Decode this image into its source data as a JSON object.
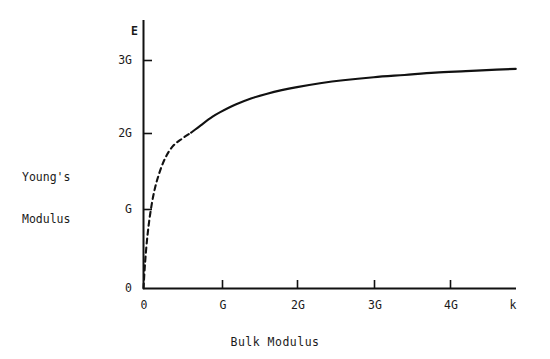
{
  "chart_data": {
    "type": "line",
    "title": "",
    "xlabel": "Bulk Modulus",
    "ylabel": "Young's Modulus",
    "x_axis_variable": "k",
    "y_axis_variable": "E",
    "xlim": [
      0,
      4.9
    ],
    "ylim": [
      0,
      3.45
    ],
    "grid": false,
    "legend": null,
    "x_tick_labels": [
      "0",
      "G",
      "2G",
      "3G",
      "4G"
    ],
    "x_tick_values": [
      0,
      1,
      2,
      3,
      4
    ],
    "y_tick_labels": [
      "0",
      "G",
      "2G",
      "3G"
    ],
    "y_tick_values": [
      0,
      1,
      2,
      3
    ],
    "units": "G (shear modulus)",
    "asymptote": 3,
    "series": [
      {
        "name": "E vs k (extrapolated)",
        "style": "dashed",
        "x": [
          0.0,
          0.02,
          0.05,
          0.09,
          0.14,
          0.2,
          0.28,
          0.38,
          0.5,
          0.62
        ],
        "y": [
          0.0,
          0.33,
          0.68,
          1.0,
          1.28,
          1.5,
          1.71,
          1.87,
          1.97,
          2.05
        ]
      },
      {
        "name": "E vs k (measured)",
        "style": "solid",
        "x": [
          0.62,
          0.75,
          0.9,
          1.0,
          1.2,
          1.4,
          1.6,
          1.8,
          2.0,
          2.3,
          2.6,
          3.0,
          3.4,
          3.8,
          4.2,
          4.6,
          4.85
        ],
        "y": [
          2.05,
          2.15,
          2.26,
          2.32,
          2.42,
          2.5,
          2.56,
          2.61,
          2.65,
          2.7,
          2.74,
          2.78,
          2.81,
          2.84,
          2.86,
          2.88,
          2.89
        ]
      }
    ],
    "annotations": [
      {
        "text": "dashed portion is extrapolation toward the origin",
        "visible": false
      }
    ],
    "colors": {
      "curve": "#111111",
      "axis": "#111111",
      "background": "#ffffff",
      "text": "#1a1a1a"
    }
  },
  "axis": {
    "y_variable_label": "E",
    "x_variable_label": "k",
    "y_ticks": [
      {
        "label": "3G"
      },
      {
        "label": "2G"
      },
      {
        "label": "G"
      },
      {
        "label": "0"
      }
    ],
    "x_ticks": [
      {
        "label": "0"
      },
      {
        "label": "G"
      },
      {
        "label": "2G"
      },
      {
        "label": "3G"
      },
      {
        "label": "4G"
      }
    ]
  },
  "labels": {
    "y_axis_title_line1": "Young's",
    "y_axis_title_line2": "Modulus",
    "x_axis_title": "Bulk Modulus"
  }
}
